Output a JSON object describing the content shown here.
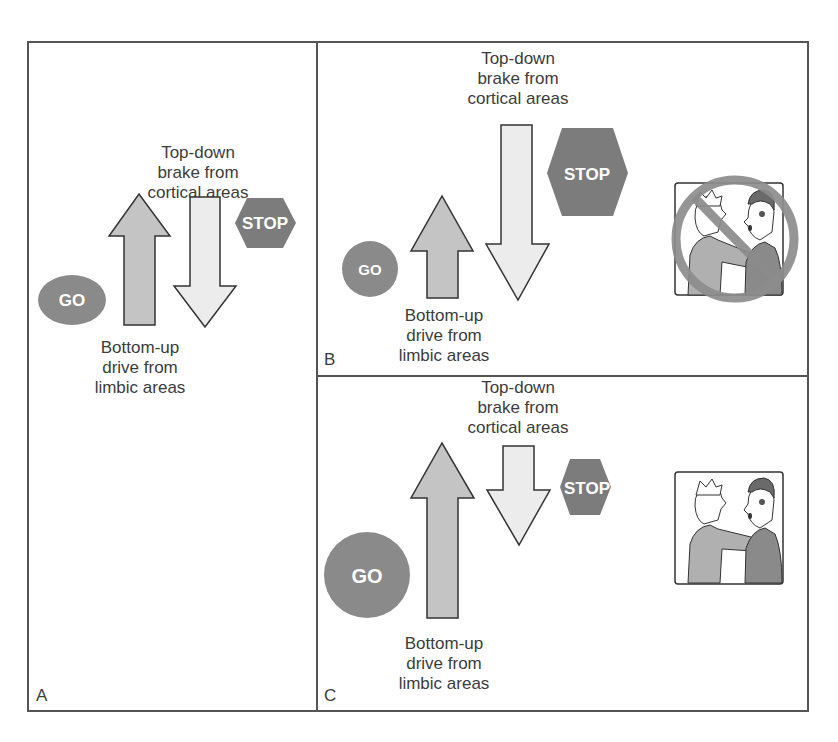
{
  "figure": {
    "panels": [
      {
        "id": "A",
        "letter": "A",
        "top_label": [
          "Top-down",
          "brake from",
          "cortical areas"
        ],
        "bottom_label": [
          "Bottom-up",
          "drive from",
          "limbic areas"
        ],
        "go_sign": "GO",
        "stop_sign": "STOP",
        "balance": "balanced"
      },
      {
        "id": "B",
        "letter": "B",
        "top_label": [
          "Top-down",
          "brake from",
          "cortical areas"
        ],
        "bottom_label": [
          "Bottom-up",
          "drive from",
          "limbic areas"
        ],
        "go_sign": "GO",
        "stop_sign": "STOP",
        "balance": "strong brake, weak drive",
        "illustration": "aggression prohibited"
      },
      {
        "id": "C",
        "letter": "C",
        "top_label": [
          "Top-down",
          "brake from",
          "cortical areas"
        ],
        "bottom_label": [
          "Bottom-up",
          "drive from",
          "limbic areas"
        ],
        "go_sign": "GO",
        "stop_sign": "STOP",
        "balance": "strong drive, weak brake",
        "illustration": "aggression occurs"
      }
    ],
    "colors": {
      "border": "#555555",
      "go_sign": "#8a8a8a",
      "stop_sign": "#7c7c7c",
      "up_arrow": "#c4c4c4",
      "down_arrow": "#ececec",
      "prohibition": "#8c8c8c",
      "text": "#3c3c3c"
    }
  }
}
